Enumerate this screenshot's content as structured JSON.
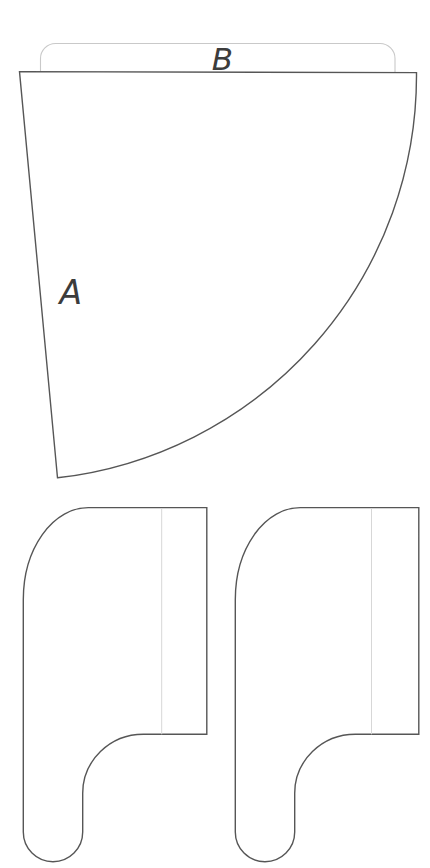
{
  "diagram": {
    "kind": "pattern-pieces-line-drawing",
    "labels": {
      "piece_a": "A",
      "piece_b": "B"
    },
    "colors": {
      "outline": "#565656",
      "guide": "#c9c9c9",
      "guide_line": "#d7d7d7",
      "label_text": "#3c3c3c",
      "background": "#ffffff"
    }
  }
}
